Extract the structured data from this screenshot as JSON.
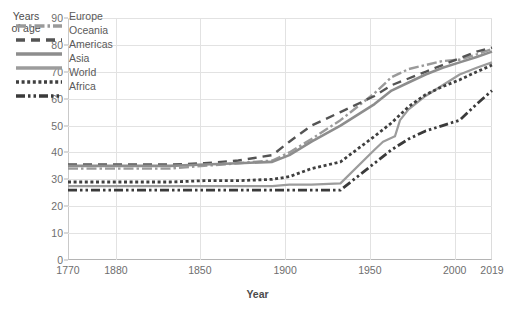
{
  "chart_data": {
    "type": "line",
    "title": "",
    "subtitle": "",
    "xlabel": "Year",
    "ylabel": "Years\nof age",
    "ylim": [
      0,
      90
    ],
    "ytick_step": 10,
    "yticks": [
      0,
      10,
      20,
      30,
      40,
      50,
      60,
      70,
      80,
      90
    ],
    "xlim": [
      1770,
      2019
    ],
    "xticks": [
      1770,
      1880,
      1850,
      1900,
      1950,
      2000,
      2019
    ],
    "xtick_labels": [
      "1770",
      "1880",
      "1850",
      "1900",
      "1950",
      "2000",
      "2019"
    ],
    "xtick_positions_frac": [
      0.0,
      0.113,
      0.311,
      0.512,
      0.712,
      0.912,
      1.0
    ],
    "grid": "both",
    "legend_position": "top-left",
    "series": [
      {
        "name": "Europe",
        "color": "#9a9a9a",
        "dash": "dash-dot",
        "width": 2.4,
        "x": [
          1770,
          1800,
          1830,
          1850,
          1870,
          1890,
          1900,
          1913,
          1930,
          1950,
          1960,
          1970,
          1980,
          1990,
          2000,
          2010,
          2019
        ],
        "y": [
          34,
          34,
          34,
          35,
          36,
          37,
          40,
          45,
          52,
          62,
          68,
          71,
          72.5,
          74,
          74.5,
          76.5,
          78.5
        ]
      },
      {
        "name": "Oceania",
        "color": "#545454",
        "dash": "long-dash",
        "width": 2.4,
        "x": [
          1770,
          1800,
          1830,
          1850,
          1870,
          1890,
          1900,
          1913,
          1930,
          1950,
          1960,
          1970,
          1980,
          1990,
          2000,
          2010,
          2019
        ],
        "y": [
          35.5,
          35.5,
          35.5,
          36,
          37,
          39,
          44,
          50,
          55,
          61,
          65,
          67.5,
          70,
          72.5,
          75,
          77.5,
          79
        ]
      },
      {
        "name": "Americas",
        "color": "#8d8d8d",
        "dash": "solid",
        "width": 2.6,
        "x": [
          1770,
          1800,
          1830,
          1850,
          1870,
          1890,
          1900,
          1913,
          1930,
          1950,
          1960,
          1970,
          1980,
          1990,
          2000,
          2010,
          2019
        ],
        "y": [
          35,
          35,
          35,
          35.5,
          36,
          36.5,
          39,
          44,
          50,
          58,
          63,
          66,
          69,
          71.5,
          73.5,
          75.5,
          77.5
        ]
      },
      {
        "name": "Asia",
        "color": "#9c9c9c",
        "dash": "solid",
        "width": 2.2,
        "x": [
          1770,
          1800,
          1830,
          1850,
          1870,
          1890,
          1900,
          1913,
          1930,
          1950,
          1955,
          1962,
          1965,
          1970,
          1980,
          1990,
          2000,
          2010,
          2019
        ],
        "y": [
          27.5,
          27.5,
          27.5,
          27.5,
          27.5,
          27.5,
          28,
          28,
          28.5,
          41,
          44,
          46,
          52,
          56,
          61,
          65,
          69,
          71.5,
          73.5
        ]
      },
      {
        "name": "World",
        "color": "#3f3f3f",
        "dash": "dotted",
        "width": 2.8,
        "x": [
          1770,
          1800,
          1830,
          1850,
          1870,
          1890,
          1900,
          1913,
          1930,
          1950,
          1960,
          1970,
          1980,
          1990,
          2000,
          2010,
          2019
        ],
        "y": [
          29,
          29,
          29,
          29.5,
          29.5,
          30,
          31,
          34,
          36.5,
          46,
          51,
          57,
          61.5,
          64.5,
          67,
          70,
          72.5
        ]
      },
      {
        "name": "Africa",
        "color": "#3a3a3a",
        "dash": "dash-dot-dot",
        "width": 2.8,
        "x": [
          1770,
          1800,
          1830,
          1850,
          1870,
          1890,
          1900,
          1913,
          1930,
          1950,
          1960,
          1970,
          1980,
          1990,
          2000,
          2010,
          2019
        ],
        "y": [
          26,
          26,
          26,
          26,
          26,
          26,
          26,
          26,
          26,
          36,
          41,
          45,
          48,
          50,
          52,
          58,
          63
        ]
      }
    ]
  },
  "legend": {
    "items": [
      {
        "label": "Europe"
      },
      {
        "label": "Oceania"
      },
      {
        "label": "Americas"
      },
      {
        "label": "Asia"
      },
      {
        "label": "World"
      },
      {
        "label": "Africa"
      }
    ]
  },
  "colors": {
    "background": "#ffffff",
    "grid": "#e2e2e2",
    "axis": "#b4b4b4",
    "text": "#6e6e6e",
    "title_text": "#4c4c4c"
  }
}
